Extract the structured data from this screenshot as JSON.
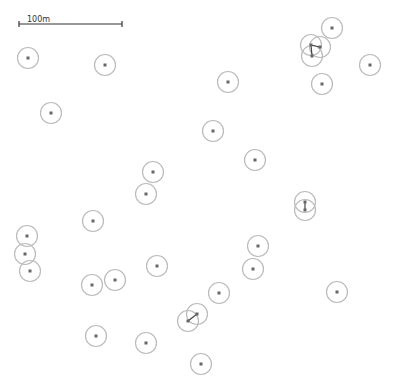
{
  "map": {
    "width": 396,
    "height": 389,
    "colors": {
      "background": "#ffffff",
      "circle_stroke": "#bbbbbb",
      "dot": "#666666",
      "line": "#444444",
      "scale": "#333333"
    },
    "circle_radius": 10.5,
    "scale_bar": {
      "label": "100m",
      "x1": 19,
      "x2": 122,
      "y": 24
    },
    "points": [
      [
        28,
        58
      ],
      [
        105,
        65
      ],
      [
        51,
        113
      ],
      [
        228,
        82
      ],
      [
        213,
        131
      ],
      [
        255,
        160
      ],
      [
        153,
        172
      ],
      [
        146,
        194
      ],
      [
        93,
        221
      ],
      [
        27,
        236
      ],
      [
        25,
        254
      ],
      [
        30,
        271
      ],
      [
        157,
        266
      ],
      [
        115,
        280
      ],
      [
        92,
        285
      ],
      [
        258,
        246
      ],
      [
        253,
        269
      ],
      [
        219,
        293
      ],
      [
        337,
        292
      ],
      [
        96,
        336
      ],
      [
        146,
        343
      ],
      [
        197,
        314
      ],
      [
        188,
        321
      ],
      [
        201,
        364
      ],
      [
        332,
        28
      ],
      [
        311,
        45
      ],
      [
        320,
        47
      ],
      [
        312,
        56
      ],
      [
        370,
        65
      ],
      [
        322,
        84
      ],
      [
        305,
        202
      ],
      [
        305,
        210
      ]
    ],
    "links": [
      [
        [
          311,
          45
        ],
        [
          320,
          47
        ]
      ],
      [
        [
          311,
          45
        ],
        [
          312,
          56
        ]
      ],
      [
        [
          305,
          202
        ],
        [
          305,
          210
        ]
      ],
      [
        [
          197,
          314
        ],
        [
          188,
          321
        ]
      ]
    ]
  }
}
